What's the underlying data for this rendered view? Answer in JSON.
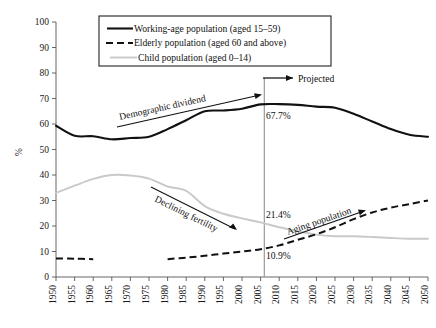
{
  "chart_data": {
    "type": "line",
    "title": "",
    "xlabel": "",
    "ylabel": "%",
    "ylim": [
      0,
      100
    ],
    "ytick_step": 10,
    "xlim": [
      1950,
      2050
    ],
    "grid": false,
    "legend_position": "top-center",
    "x": [
      1950,
      1955,
      1960,
      1965,
      1970,
      1975,
      1980,
      1985,
      1990,
      1995,
      2000,
      2005,
      2010,
      2015,
      2020,
      2025,
      2030,
      2035,
      2040,
      2045,
      2050
    ],
    "xtick_labels": [
      "1950",
      "1955",
      "1960",
      "1965",
      "1970",
      "1975",
      "1980",
      "1985",
      "1990",
      "1995",
      "2000",
      "2005",
      "2010",
      "2015",
      "2020",
      "2025",
      "2030",
      "2035",
      "2040",
      "2045",
      "2050"
    ],
    "ytick_labels": [
      "0",
      "10",
      "20",
      "30",
      "40",
      "50",
      "60",
      "70",
      "80",
      "90",
      "100"
    ],
    "series": [
      {
        "name": "Working-age population (aged 15–59)",
        "style": "solid-black",
        "color": "#111111",
        "values": [
          59.3,
          55.4,
          55.2,
          54.0,
          54.5,
          55.0,
          58.0,
          61.5,
          65.0,
          65.3,
          66.0,
          67.7,
          67.8,
          67.5,
          66.8,
          66.4,
          64.0,
          61.0,
          58.0,
          55.8,
          55.0
        ]
      },
      {
        "name": "Elderly population (aged 60 and above)",
        "style": "dashed-black",
        "color": "#111111",
        "values": [
          7.3,
          7.2,
          7.0,
          null,
          null,
          null,
          7.0,
          7.6,
          8.3,
          9.2,
          10.0,
          10.9,
          12.4,
          14.6,
          16.8,
          19.5,
          22.7,
          25.3,
          27.2,
          28.6,
          30.0
        ]
      },
      {
        "name": "Child population (aged 0–14)",
        "style": "solid-gray",
        "color": "#c9c9c9",
        "values": [
          33.0,
          35.8,
          38.5,
          40.0,
          39.8,
          38.6,
          35.5,
          33.8,
          27.8,
          24.8,
          23.0,
          21.4,
          19.5,
          18.0,
          16.6,
          16.0,
          16.0,
          15.7,
          15.3,
          15.0,
          15.0
        ]
      }
    ],
    "annotations": [
      {
        "id": "demographic-dividend",
        "text": "Demographic dividend",
        "kind": "arrow-label",
        "direction": "up-right"
      },
      {
        "id": "declining-fertility",
        "text": "Declining fertility",
        "kind": "arrow-label",
        "direction": "down-right"
      },
      {
        "id": "aging-population",
        "text": "Aging population",
        "kind": "arrow-label",
        "direction": "up-right"
      },
      {
        "id": "projected",
        "text": "Projected",
        "kind": "arrow-label",
        "direction": "right"
      }
    ],
    "value_labels": [
      {
        "id": "working-2005",
        "text": "67.7%",
        "x": 2005,
        "y": 67.7
      },
      {
        "id": "child-2005",
        "text": "21.4%",
        "x": 2005,
        "y": 21.4
      },
      {
        "id": "elderly-2005",
        "text": "10.9%",
        "x": 2005,
        "y": 10.9
      }
    ],
    "divider": {
      "id": "projection-divider",
      "x": 2006,
      "label": "Projected",
      "color": "#9a9a9a"
    }
  },
  "legend": {
    "items": [
      {
        "label": "Working-age population (aged 15–59)",
        "style": "solid-black"
      },
      {
        "label": "Elderly population (aged 60 and above)",
        "style": "dashed-black"
      },
      {
        "label": "Child population (aged 0–14)",
        "style": "solid-gray"
      }
    ]
  },
  "axes": {
    "y_axis_title": "%"
  },
  "colors": {
    "working": "#111111",
    "elderly": "#111111",
    "child": "#c9c9c9",
    "divider": "#9a9a9a",
    "axis": "#555555"
  }
}
